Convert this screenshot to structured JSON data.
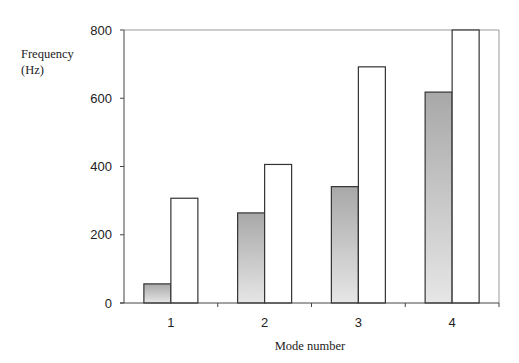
{
  "chart_data": {
    "type": "bar",
    "title": "",
    "xlabel": "Mode number",
    "ylabel": "Frequency (Hz)",
    "ylabel_lines": [
      "Frequency",
      "(Hz)"
    ],
    "categories": [
      "1",
      "2",
      "3",
      "4"
    ],
    "series": [
      {
        "name": "Series A (shaded)",
        "values": [
          56,
          264,
          341,
          618
        ],
        "fill": "gradient",
        "color_top": "#a8a8a8",
        "color_bottom": "#e6e6e6"
      },
      {
        "name": "Series B (white)",
        "values": [
          307,
          406,
          692,
          800
        ],
        "fill": "#ffffff"
      }
    ],
    "ylim": [
      0,
      800
    ],
    "yticks": [
      0,
      200,
      400,
      600,
      800
    ],
    "grid": false,
    "legend": null
  }
}
